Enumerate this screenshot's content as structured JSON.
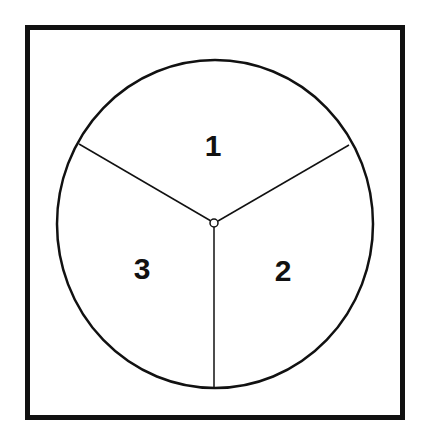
{
  "diagram": {
    "type": "circle-divided-into-three-sectors",
    "colors": {
      "stroke": "#111111",
      "background": "#ffffff"
    },
    "sectors": [
      {
        "label": "1",
        "position": "top"
      },
      {
        "label": "2",
        "position": "bottom-right"
      },
      {
        "label": "3",
        "position": "bottom-left"
      }
    ],
    "center_marker": "small-circle"
  }
}
